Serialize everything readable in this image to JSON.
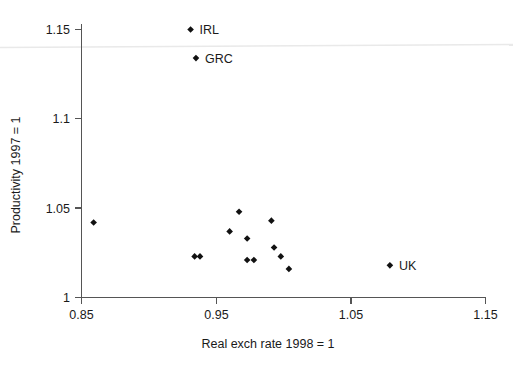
{
  "chart_data": {
    "type": "scatter",
    "title": "",
    "xlabel": "Real exch rate 1998 = 1",
    "ylabel": "Productivity 1997 = 1",
    "xlim": [
      0.85,
      1.15
    ],
    "ylim": [
      1.0,
      1.15
    ],
    "xticks": [
      "0.85",
      "0.95",
      "1.05",
      "1.15"
    ],
    "xtick_values": [
      0.85,
      0.95,
      1.05,
      1.15
    ],
    "yticks": [
      "1",
      "1.05",
      "1.1",
      "1.15"
    ],
    "ytick_values": [
      1,
      1.05,
      1.1,
      1.15
    ],
    "grid": false,
    "legend": "none",
    "marker": "diamond",
    "marker_color": "#111111",
    "points": [
      {
        "label": "IRL",
        "x": 0.931,
        "y": 1.15,
        "label_side": "right"
      },
      {
        "label": "GRC",
        "x": 0.935,
        "y": 1.134,
        "label_side": "right"
      },
      {
        "label": "",
        "x": 0.859,
        "y": 1.042,
        "label_side": "none"
      },
      {
        "label": "",
        "x": 0.967,
        "y": 1.048,
        "label_side": "none"
      },
      {
        "label": "",
        "x": 0.96,
        "y": 1.037,
        "label_side": "none"
      },
      {
        "label": "",
        "x": 0.973,
        "y": 1.033,
        "label_side": "none"
      },
      {
        "label": "",
        "x": 0.991,
        "y": 1.043,
        "label_side": "none"
      },
      {
        "label": "",
        "x": 0.993,
        "y": 1.028,
        "label_side": "none"
      },
      {
        "label": "",
        "x": 0.998,
        "y": 1.023,
        "label_side": "none"
      },
      {
        "label": "",
        "x": 0.934,
        "y": 1.023,
        "label_side": "none"
      },
      {
        "label": "",
        "x": 0.938,
        "y": 1.023,
        "label_side": "none"
      },
      {
        "label": "",
        "x": 0.973,
        "y": 1.021,
        "label_side": "none"
      },
      {
        "label": "",
        "x": 0.978,
        "y": 1.021,
        "label_side": "none"
      },
      {
        "label": "",
        "x": 1.004,
        "y": 1.016,
        "label_side": "none"
      },
      {
        "label": "UK",
        "x": 1.079,
        "y": 1.018,
        "label_side": "right"
      }
    ]
  },
  "axes": {
    "y_title": "Productivity 1997 = 1",
    "x_title": "Real exch rate 1998 = 1",
    "y_tick_labels": [
      "1.15",
      "1.1",
      "1.05",
      "1"
    ],
    "x_tick_labels": [
      "0.85",
      "0.95",
      "1.05",
      "1.15"
    ]
  },
  "annotations": {
    "irl": "IRL",
    "grc": "GRC",
    "uk": "UK"
  },
  "colors": {
    "marker": "#111111",
    "axis": "#555555",
    "text": "#1a1a1a",
    "background": "#ffffff"
  }
}
